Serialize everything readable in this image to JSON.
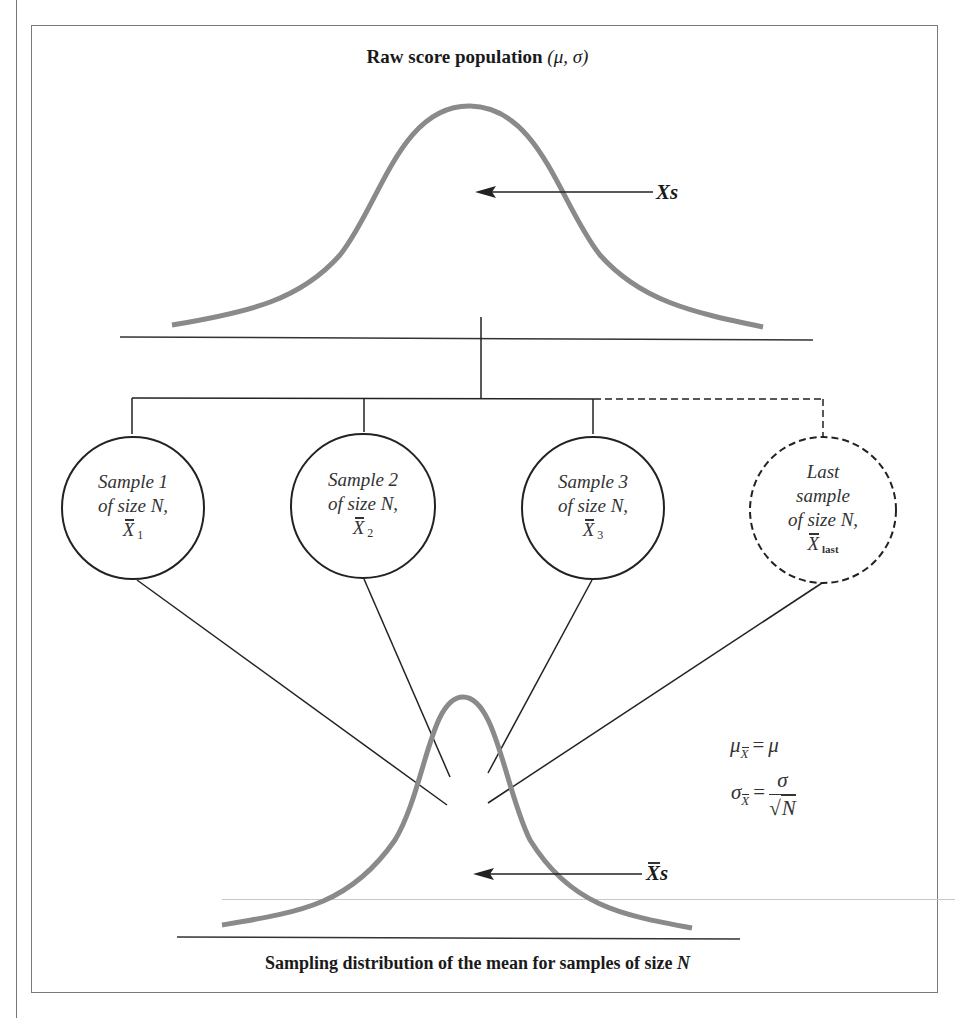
{
  "figure": {
    "top_title": {
      "text": "Raw score population",
      "params": "(μ, σ)"
    },
    "population_arrow_label": "Xs",
    "samples": [
      {
        "line1": "Sample 1",
        "line2": "of size N,",
        "mean_symbol": "X",
        "mean_subscript": "1",
        "style": "solid"
      },
      {
        "line1": "Sample 2",
        "line2": "of size N,",
        "mean_symbol": "X",
        "mean_subscript": "2",
        "style": "solid"
      },
      {
        "line1": "Sample 3",
        "line2": "of size N,",
        "mean_symbol": "X",
        "mean_subscript": "3",
        "style": "solid"
      },
      {
        "line0": "Last",
        "line1": "sample",
        "line2": "of size N,",
        "mean_symbol": "X",
        "mean_subscript": "last",
        "style": "dashed"
      }
    ],
    "formulas": {
      "mean": {
        "lhs": "μ",
        "lhs_sub": "X",
        "eq": "=",
        "rhs": "μ"
      },
      "sd": {
        "lhs": "σ",
        "lhs_sub": "X",
        "eq": "=",
        "num": "σ",
        "den_root": "√",
        "den": "N"
      }
    },
    "sampling_arrow_label": "s",
    "sampling_arrow_symbol": "X",
    "bottom_title": {
      "text": "Sampling distribution of the mean for samples of size",
      "var": "N"
    },
    "colors": {
      "curve": "#8a8a8a",
      "line": "#222222",
      "frame": "#7a7a7a"
    }
  }
}
